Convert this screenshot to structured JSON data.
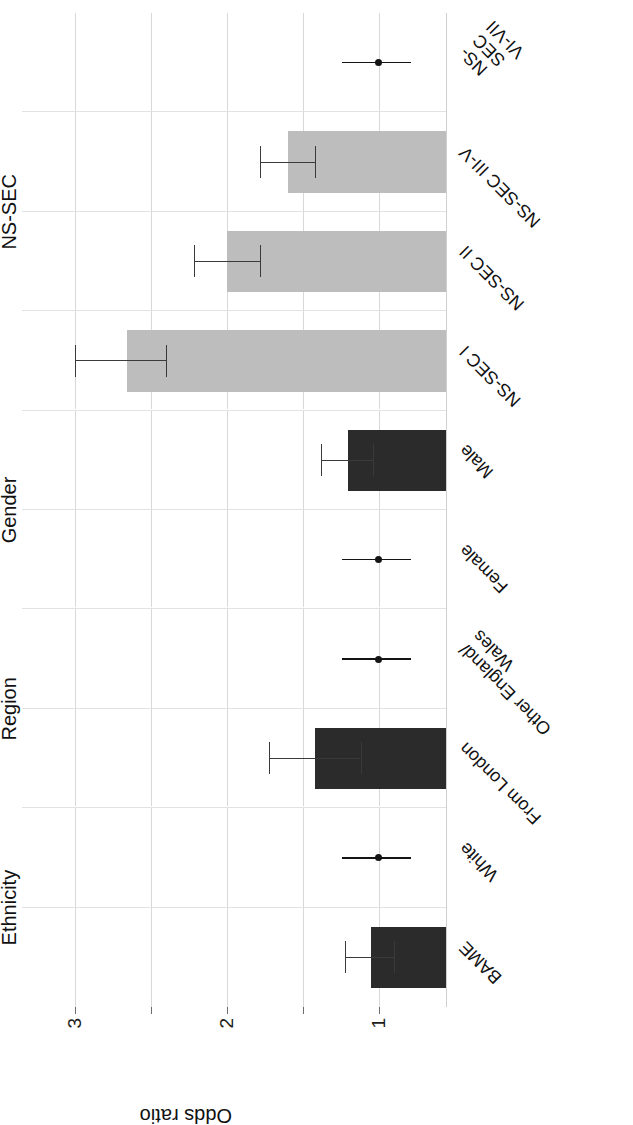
{
  "chart_data": {
    "type": "bar",
    "title": "",
    "subtitle": "",
    "xlabel": "",
    "ylabel": "Odds ratio",
    "ylim": [
      0.55,
      3.35
    ],
    "yticks": [
      1,
      2,
      3
    ],
    "ytick_labels": [
      "1",
      "2",
      "3"
    ],
    "grid": true,
    "legend": "none",
    "reference_value": 1,
    "orientation": "vertical bars; whole figure rotated 90° counter-clockwise",
    "groups": [
      {
        "name": "Ethnicity",
        "categories": [
          {
            "label": "BAME",
            "value": 1.05,
            "ci_low": 0.9,
            "ci_high": 1.22,
            "style": "dark-bar",
            "reference": false
          },
          {
            "label": "White",
            "value": 1,
            "ci_low": 1,
            "ci_high": 1,
            "style": "reference-point",
            "reference": true
          }
        ]
      },
      {
        "name": "Region",
        "categories": [
          {
            "label": "From London",
            "value": 1.42,
            "ci_low": 1.12,
            "ci_high": 1.72,
            "style": "dark-bar",
            "reference": false
          },
          {
            "label": "Other England/\nWales",
            "value": 1,
            "ci_low": 1,
            "ci_high": 1,
            "style": "reference-point",
            "reference": true
          }
        ]
      },
      {
        "name": "Gender",
        "categories": [
          {
            "label": "Female",
            "value": 1,
            "ci_low": 1,
            "ci_high": 1,
            "style": "reference-point",
            "reference": true
          },
          {
            "label": "Male",
            "value": 1.2,
            "ci_low": 1.04,
            "ci_high": 1.38,
            "style": "dark-bar",
            "reference": false
          }
        ]
      },
      {
        "name": "NS-SEC",
        "categories": [
          {
            "label": "NS-SEC I",
            "value": 2.66,
            "ci_low": 2.4,
            "ci_high": 3.0,
            "style": "light-bar",
            "reference": false
          },
          {
            "label": "NS-SEC II",
            "value": 2.0,
            "ci_low": 1.78,
            "ci_high": 2.22,
            "style": "light-bar",
            "reference": false
          },
          {
            "label": "NS-SEC III-V",
            "value": 1.6,
            "ci_low": 1.42,
            "ci_high": 1.78,
            "style": "light-bar",
            "reference": false
          },
          {
            "label": "NS-SEC VI-VII",
            "value": 1,
            "ci_low": 1,
            "ci_high": 1,
            "style": "reference-point",
            "reference": true
          }
        ]
      }
    ],
    "colors": {
      "light_bar": "#bdbdbd",
      "dark_bar": "#2b2b2b",
      "error_bar": "#3a3a3a",
      "reference_marker": "#141414",
      "gridline": "#d8d8d8",
      "background": "#ffffff"
    }
  }
}
